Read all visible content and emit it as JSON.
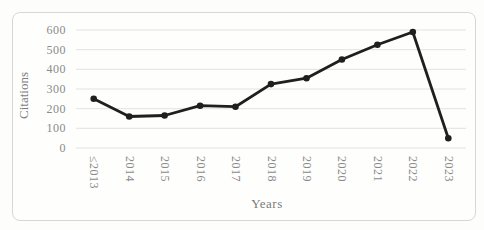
{
  "chart_data": {
    "type": "line",
    "title": "",
    "xlabel": "Years",
    "ylabel": "Citations",
    "categories": [
      "≤2013",
      "2014",
      "2015",
      "2016",
      "2017",
      "2018",
      "2019",
      "2020",
      "2021",
      "2022",
      "2023"
    ],
    "values": [
      250,
      160,
      165,
      215,
      210,
      325,
      355,
      450,
      525,
      590,
      50
    ],
    "ylim": [
      0,
      600
    ],
    "yticks": [
      0,
      100,
      200,
      300,
      400,
      500,
      600
    ],
    "grid": "horizontal-gridlines",
    "legend_position": "none",
    "marker": "filled-circle",
    "x_tick_rotation_deg": 90,
    "colors": {
      "line": "#1f1f1f",
      "marker": "#1f1f1f",
      "gridline": "#e2e2e2",
      "tick_label": "#8a8a8a",
      "axis_title": "#7b7b7b",
      "frame_border": "#d7d7d7",
      "background": "#fdfdfc"
    }
  }
}
